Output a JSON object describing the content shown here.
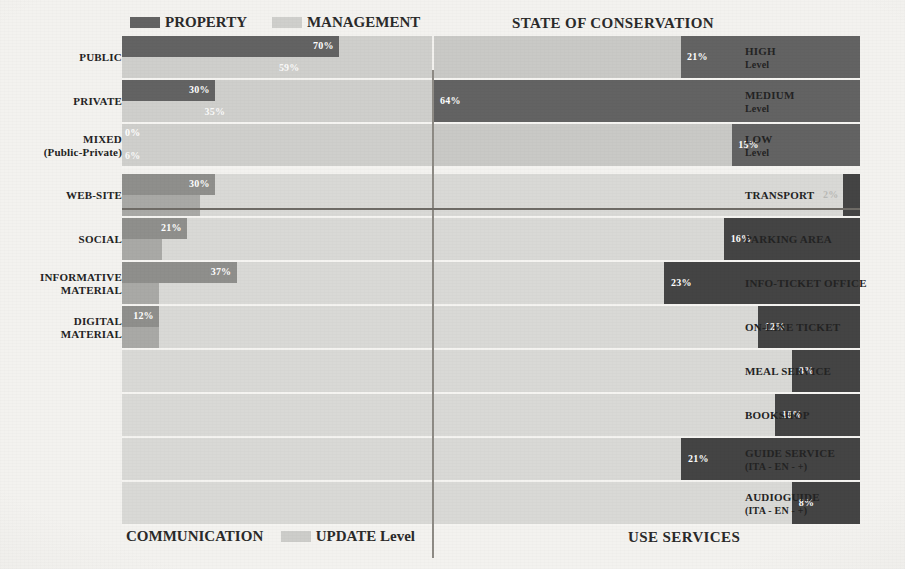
{
  "colors": {
    "paper": "#f3f2ef",
    "property_dark": "#636363",
    "management_light": "#cfcfcc",
    "communication_dark": "#8f8f8c",
    "update_level": "#a9a9a6",
    "right_dark": "#444444",
    "right_light": "#c9c9c6",
    "band_light": "#d9d9d6",
    "text": "#232323"
  },
  "legend_top": {
    "property_label": "PROPERTY",
    "management_label": "MANAGEMENT"
  },
  "legend_bottom": {
    "communication_label": "COMMUNICATION",
    "update_label": "UPDATE Level"
  },
  "titles": {
    "state_of_conservation": "STATE OF CONSERVATION",
    "use_services": "USE SERVICES"
  },
  "chart_data": {
    "type": "bar",
    "xlabel": "",
    "ylabel": "",
    "xlim": [
      0,
      100
    ],
    "grid": false,
    "legend_position": "top-left and bottom-left",
    "panels": [
      {
        "name": "property-management",
        "position": "top-left",
        "orientation": "horizontal",
        "anchor": "left",
        "series": [
          {
            "name": "PROPERTY",
            "color": "#636363"
          },
          {
            "name": "MANAGEMENT",
            "color": "#cfcfcc"
          }
        ],
        "categories": [
          "PUBLIC",
          "PRIVATE",
          "MIXED (Public-Private)"
        ],
        "rows": [
          {
            "label": "PUBLIC",
            "label_line1": "PUBLIC",
            "label_line2": "",
            "property": 70,
            "property_text": "70%",
            "management": 59,
            "management_text": "59%"
          },
          {
            "label": "PRIVATE",
            "label_line1": "PRIVATE",
            "label_line2": "",
            "property": 30,
            "property_text": "30%",
            "management": 35,
            "management_text": "35%"
          },
          {
            "label": "MIXED (Public-Private)",
            "label_line1": "MIXED",
            "label_line2": "(Public-Private)",
            "property": 0,
            "property_text": "0%",
            "management": 6,
            "management_text": "6%"
          }
        ]
      },
      {
        "name": "communication-update",
        "position": "bottom-left",
        "orientation": "horizontal",
        "anchor": "left",
        "series": [
          {
            "name": "COMMUNICATION",
            "color": "#8f8f8c"
          },
          {
            "name": "UPDATE Level",
            "color": "#a9a9a6"
          }
        ],
        "categories": [
          "WEB-SITE",
          "SOCIAL",
          "INFORMATIVE MATERIAL",
          "DIGITAL MATERIAL"
        ],
        "rows": [
          {
            "label": "WEB-SITE",
            "label_line1": "WEB-SITE",
            "label_line2": "",
            "communication": 30,
            "communication_text": "30%",
            "update": 25
          },
          {
            "label": "SOCIAL",
            "label_line1": "SOCIAL",
            "label_line2": "",
            "communication": 21,
            "communication_text": "21%",
            "update": 13
          },
          {
            "label": "INFORMATIVE MATERIAL",
            "label_line1": "INFORMATIVE",
            "label_line2": "MATERIAL",
            "communication": 37,
            "communication_text": "37%",
            "update": 12
          },
          {
            "label": "DIGITAL MATERIAL",
            "label_line1": "DIGITAL",
            "label_line2": "MATERIAL",
            "communication": 12,
            "communication_text": "12%",
            "update": 12
          }
        ]
      },
      {
        "name": "state-of-conservation",
        "position": "top-right",
        "orientation": "horizontal",
        "anchor": "right",
        "series": [
          {
            "name": "Level",
            "color": "#444444"
          }
        ],
        "categories": [
          "HIGH Level",
          "MEDIUM Level",
          "LOW Level"
        ],
        "values": [
          21,
          64,
          15
        ],
        "rows": [
          {
            "label_line1": "HIGH",
            "label_line2": "Level",
            "value": 21,
            "value_text": "21%"
          },
          {
            "label_line1": "MEDIUM",
            "label_line2": "Level",
            "value": 64,
            "value_text": "64%"
          },
          {
            "label_line1": "LOW",
            "label_line2": "Level",
            "value": 15,
            "value_text": "15%"
          }
        ]
      },
      {
        "name": "use-services",
        "position": "bottom-right",
        "orientation": "horizontal",
        "anchor": "right",
        "series": [
          {
            "name": "Service",
            "color": "#444444"
          }
        ],
        "categories": [
          "TRANSPORT",
          "PARKING AREA",
          "INFO-TICKET OFFICE",
          "ON-LINE TICKET",
          "MEAL SERVICE",
          "BOOKSHOP",
          "GUIDE SERVICE (ITA - EN - +)",
          "AUDIOGUIDE (ITA - EN - +)"
        ],
        "values": [
          2,
          16,
          23,
          12,
          8,
          10,
          21,
          8
        ],
        "rows": [
          {
            "label_line1": "TRANSPORT",
            "label_line2": "",
            "value": 2,
            "value_text": "2%"
          },
          {
            "label_line1": "PARKING AREA",
            "label_line2": "",
            "value": 16,
            "value_text": "16%"
          },
          {
            "label_line1": "INFO-TICKET OFFICE",
            "label_line2": "",
            "value": 23,
            "value_text": "23%"
          },
          {
            "label_line1": "ON-LINE TICKET",
            "label_line2": "",
            "value": 12,
            "value_text": "12%"
          },
          {
            "label_line1": "MEAL SERVICE",
            "label_line2": "",
            "value": 8,
            "value_text": "8%"
          },
          {
            "label_line1": "BOOKSHOP",
            "label_line2": "",
            "value": 10,
            "value_text": "10%"
          },
          {
            "label_line1": "GUIDE SERVICE",
            "label_line2": "(ITA - EN - +)",
            "value": 21,
            "value_text": "21%"
          },
          {
            "label_line1": "AUDIOGUIDE",
            "label_line2": "(ITA - EN - +)",
            "value": 8,
            "value_text": "8%"
          }
        ]
      }
    ]
  }
}
